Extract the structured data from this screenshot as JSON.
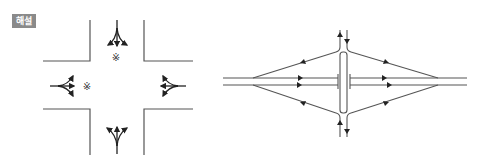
{
  "badge": {
    "label": "해설"
  },
  "colors": {
    "line": "#555555",
    "arrow": "#222222",
    "badge_bg": "#8a8a8a"
  },
  "diagrams": [
    {
      "name": "four-way-intersection",
      "symbol": "※",
      "conflict_markers": 2
    },
    {
      "name": "diamond-interchange"
    }
  ]
}
